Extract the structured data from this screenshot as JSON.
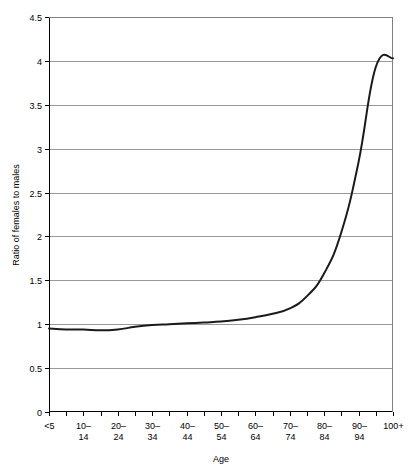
{
  "chart_data": {
    "type": "line",
    "title": "",
    "xlabel": "Age",
    "ylabel": "Ratio of females to males",
    "categories": [
      "<5",
      "5–9",
      "10–14",
      "15–19",
      "20–24",
      "25–29",
      "30–34",
      "35–39",
      "40–44",
      "45–49",
      "50–54",
      "55–59",
      "60–64",
      "65–69",
      "70–74",
      "75–79",
      "80–84",
      "85–89",
      "90–94",
      "95–99",
      "100+"
    ],
    "tick_labels_x": [
      "<5",
      "",
      "10–14",
      "",
      "20–24",
      "",
      "30–34",
      "",
      "40–44",
      "",
      "50–54",
      "",
      "60–64",
      "",
      "70–74",
      "",
      "80–84",
      "",
      "90–94",
      "",
      "100+"
    ],
    "values": [
      0.95,
      0.94,
      0.94,
      0.93,
      0.94,
      0.97,
      0.99,
      1.0,
      1.01,
      1.02,
      1.03,
      1.05,
      1.08,
      1.12,
      1.18,
      1.32,
      1.58,
      2.05,
      2.85,
      3.93,
      4.03
    ],
    "ylim": [
      0,
      4.5
    ],
    "ytick_values": [
      0,
      0.5,
      1,
      1.5,
      2,
      2.5,
      3,
      3.5,
      4,
      4.5
    ],
    "ytick_labels": [
      "0",
      "0.5",
      "1",
      "1.5",
      "2",
      "2.5",
      "3",
      "3.5",
      "4",
      "4.5"
    ],
    "grid": true,
    "grid_axis": "y",
    "legend": false,
    "legend_position": "none",
    "series_color": "#1a1a1a",
    "gridline_color": "#9a9a9a",
    "background_color": "#ffffff"
  }
}
